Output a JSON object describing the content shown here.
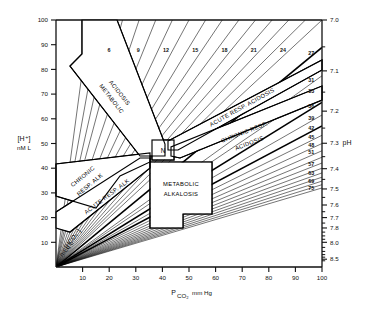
{
  "figure": {
    "type": "acid-base-nomogram",
    "title": ""
  },
  "axes": {
    "left": {
      "label_main": "[H⁺]",
      "label_sub": "nM L",
      "ticks": [
        100,
        90,
        80,
        70,
        60,
        50,
        40,
        30,
        20,
        10
      ],
      "min": 0,
      "max": 100
    },
    "bottom": {
      "label_main": "P",
      "label_sub": "CO₂",
      "label_unit": "mm Hg",
      "ticks": [
        10,
        20,
        30,
        40,
        50,
        60,
        70,
        80,
        90,
        100
      ],
      "min": 0,
      "max": 100
    },
    "right": {
      "label": "pH",
      "ticks": [
        "7.0",
        "7.1",
        "7.2",
        "7.3",
        "7.4",
        "7.5",
        "7.6",
        "7.7",
        "7.8",
        "8.0",
        "8.5"
      ],
      "tick_h_values": [
        100,
        79.4,
        63.1,
        50.1,
        39.8,
        31.6,
        25.1,
        20.0,
        15.8,
        10.0,
        3.16
      ]
    },
    "bicarbonate": {
      "label_main": "[HCO₃⁻]",
      "label_sub": "mEq L"
    }
  },
  "chart_data": {
    "type": "line",
    "xlabel": "PCO2 mm Hg",
    "ylabel": "[H+] nM/L",
    "y2label": "pH",
    "xlim": [
      0,
      100
    ],
    "ylim": [
      0,
      100
    ],
    "grid": false,
    "legend": "none",
    "isopleth_quantity": "[HCO3-] mEq/L",
    "isopleth_relation": "H+ = 24 * PCO2 / HCO3-",
    "isopleths_top_labeled": [
      6,
      9,
      12,
      15,
      18,
      21,
      24
    ],
    "isopleths_right_labeled": [
      27,
      31,
      33,
      36,
      39,
      42,
      45,
      48,
      51,
      57,
      63,
      69,
      75
    ],
    "isopleths_all": [
      3,
      4,
      5,
      6,
      7.5,
      9,
      10.5,
      12,
      13.5,
      15,
      16.5,
      18,
      19.5,
      21,
      22.5,
      24,
      27,
      31,
      33,
      36,
      39,
      42,
      45,
      48,
      51,
      54,
      57,
      60,
      63,
      66,
      69,
      72,
      75
    ],
    "normal_point": {
      "pco2": 40,
      "h": 40,
      "ph": "7.40",
      "label": "N"
    }
  },
  "zones": [
    {
      "id": "metabolic-acidosis",
      "line1": "METABOLIC",
      "line2": "ACIDOSIS"
    },
    {
      "id": "acute-resp-acidosis",
      "line1": "ACUTE RESP. ACIDOSIS",
      "line2": ""
    },
    {
      "id": "chronic-resp-acidosis",
      "line1": "CHRONIC RESP.",
      "line2": "ACIDOSIS"
    },
    {
      "id": "chronic-resp-alkalosis",
      "line1": "CHRONIC",
      "line2": "RESP. ALK"
    },
    {
      "id": "acute-resp-alkalosis",
      "line1": "ACUTE RESP. ALK",
      "line2": ""
    },
    {
      "id": "metabolic-alkalosis",
      "line1": "METABOLIC",
      "line2": "ALKALOSIS"
    },
    {
      "id": "normal",
      "line1": "N",
      "line2": ""
    }
  ],
  "colors": {
    "ink": "#000000",
    "background": "#ffffff",
    "axis": "#111111"
  }
}
